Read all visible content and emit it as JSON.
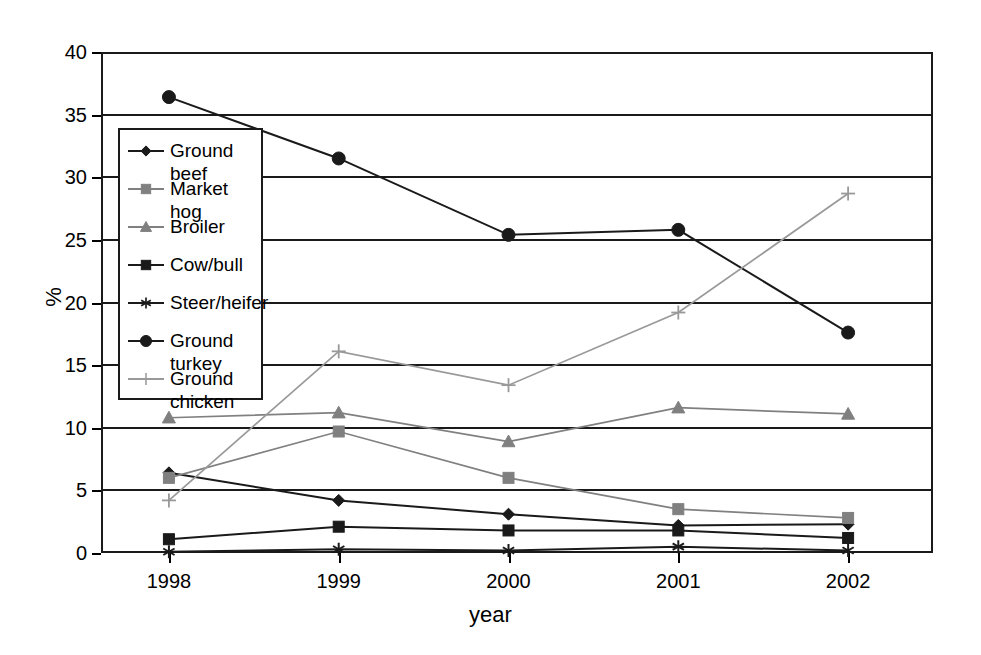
{
  "chart_data": {
    "type": "line",
    "title": "",
    "xlabel": "year",
    "ylabel": "%",
    "categories": [
      "1998",
      "1999",
      "2000",
      "2001",
      "2002"
    ],
    "x": [
      1998,
      1999,
      2000,
      2001,
      2002
    ],
    "xlim": [
      1997.6,
      2002.5
    ],
    "ylim": [
      0,
      40
    ],
    "ytick_values": [
      0,
      5,
      10,
      15,
      20,
      25,
      30,
      35,
      40
    ],
    "ytick_labels": [
      "0",
      "5",
      "10",
      "15",
      "20",
      "25",
      "30",
      "35",
      "40"
    ],
    "grid": "horizontal",
    "legend_position": "inside-left",
    "series": [
      {
        "name": "Ground beef",
        "marker": "diamond",
        "color": "#1a1a1a",
        "values": [
          6.4,
          4.2,
          3.1,
          2.2,
          2.3
        ]
      },
      {
        "name": "Market hog",
        "marker": "square",
        "color": "#808080",
        "values": [
          6.0,
          9.7,
          6.0,
          3.5,
          2.8
        ]
      },
      {
        "name": "Broiler",
        "marker": "triangle",
        "color": "#808080",
        "values": [
          10.8,
          11.2,
          8.9,
          11.6,
          11.1
        ]
      },
      {
        "name": "Cow/bull",
        "marker": "square",
        "color": "#1a1a1a",
        "values": [
          1.1,
          2.1,
          1.8,
          1.8,
          1.2
        ]
      },
      {
        "name": "Steer/heifer",
        "marker": "asterisk",
        "color": "#1a1a1a",
        "values": [
          0.1,
          0.3,
          0.2,
          0.5,
          0.2
        ]
      },
      {
        "name": "Ground turkey",
        "marker": "circle",
        "color": "#1a1a1a",
        "values": [
          36.4,
          31.5,
          25.4,
          25.8,
          17.6
        ]
      },
      {
        "name": "Ground chicken",
        "label_lines": "Ground\nchicken",
        "marker": "plus",
        "color": "#999999",
        "values": [
          4.2,
          16.1,
          13.4,
          19.2,
          28.7
        ]
      }
    ]
  },
  "legend": {
    "items": [
      {
        "label": "Ground beef"
      },
      {
        "label": "Market hog"
      },
      {
        "label": "Broiler"
      },
      {
        "label": "Cow/bull"
      },
      {
        "label": "Steer/heifer"
      },
      {
        "label": "Ground turkey"
      },
      {
        "label": "Ground\nchicken"
      }
    ]
  }
}
